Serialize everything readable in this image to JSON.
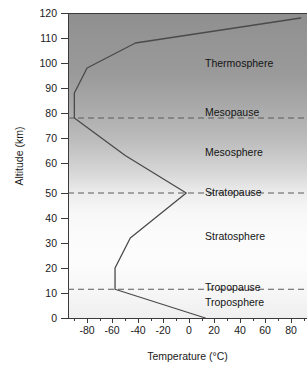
{
  "chart_data": {
    "type": "line",
    "title": "",
    "xlabel": "Temperature (°C)",
    "ylabel": "Altitude (km)",
    "xlim": [
      -95,
      93
    ],
    "ylim": [
      0,
      122
    ],
    "xticks": [
      -80,
      -60,
      -40,
      -20,
      0,
      20,
      40,
      60,
      80
    ],
    "xtick_labels": [
      "-80",
      "-60",
      "-40",
      "-20",
      "0",
      "20",
      "40",
      "60",
      "80"
    ],
    "xminor_step": 10,
    "yticks": [
      0,
      10,
      20,
      30,
      40,
      50,
      60,
      70,
      80,
      90,
      100,
      110,
      120
    ],
    "ytick_labels": [
      "0",
      "10",
      "20",
      "30",
      "40",
      "50",
      "60",
      "70",
      "80",
      "90",
      "100",
      "110",
      "120"
    ],
    "grid": false,
    "legend": "none",
    "series": [
      {
        "name": "Standard atmosphere temperature profile",
        "color": "#4a4a4a",
        "x": [
          13,
          -58,
          -58,
          -46,
          -2,
          -50,
          -90,
          -90,
          -80,
          -42,
          88
        ],
        "y": [
          0,
          11.5,
          20,
          32,
          50,
          65,
          80,
          90,
          100,
          110,
          120
        ]
      }
    ],
    "reference_lines": [
      {
        "label": "Mesopause",
        "altitude": 80,
        "style": "dashed",
        "color": "#5a5a5a"
      },
      {
        "label": "Stratopause",
        "altitude": 50,
        "style": "dashed",
        "color": "#5a5a5a"
      },
      {
        "label": "Tropopause",
        "altitude": 11.5,
        "style": "dashed",
        "color": "#5a5a5a"
      }
    ],
    "annotations": [
      {
        "text": "Thermosphere",
        "altitude": 101,
        "temperature": 22
      },
      {
        "text": "Mesopause",
        "altitude": 80,
        "temperature": 22
      },
      {
        "text": "Mesosphere",
        "altitude": 66,
        "temperature": 22
      },
      {
        "text": "Stratopause",
        "altitude": 50,
        "temperature": 22
      },
      {
        "text": "Stratosphere",
        "altitude": 30,
        "temperature": 22
      },
      {
        "text": "Tropopause",
        "altitude": 11.5,
        "temperature": 22
      },
      {
        "text": "Troposphere",
        "altitude": 6,
        "temperature": 22
      }
    ]
  },
  "axes": {
    "x_title": "Temperature (°C)",
    "y_title": "Altitude (km)",
    "x_labels": [
      "-80",
      "-60",
      "-40",
      "-20",
      "0",
      "20",
      "40",
      "60",
      "80"
    ],
    "y_labels": [
      "120",
      "110",
      "100",
      "90",
      "80",
      "70",
      "60",
      "50",
      "40",
      "30",
      "20",
      "10",
      "0"
    ]
  },
  "layers": {
    "thermosphere": "Thermosphere",
    "mesopause": "Mesopause",
    "mesosphere": "Mesosphere",
    "stratopause": "Stratopause",
    "stratosphere": "Stratosphere",
    "tropopause": "Tropopause",
    "troposphere": "Troposphere"
  }
}
